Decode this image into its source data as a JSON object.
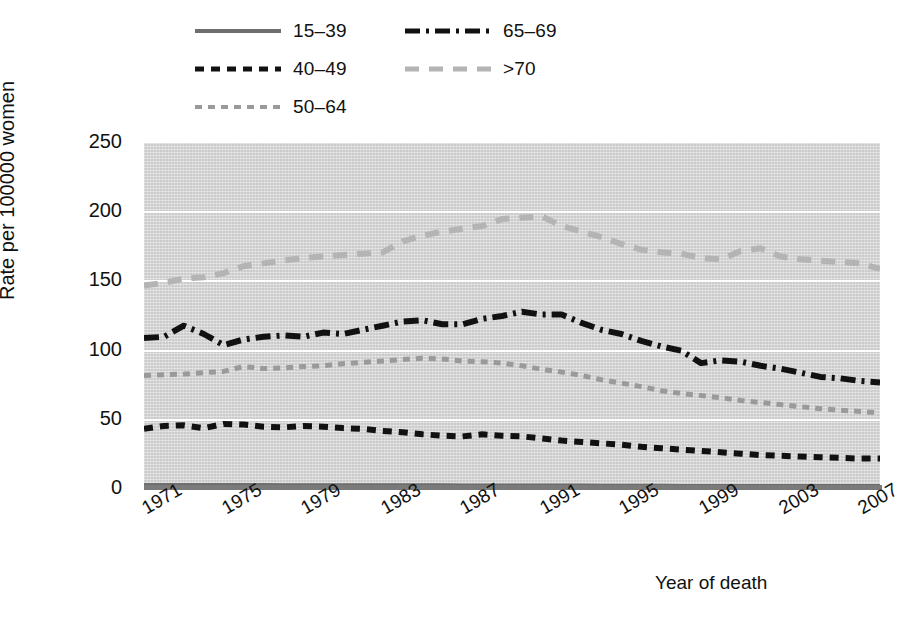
{
  "chart_data": {
    "type": "line",
    "title": "",
    "xlabel": "Year of death",
    "ylabel": "Rate per 100000 women",
    "xlim": [
      1971,
      2008
    ],
    "ylim": [
      0,
      250
    ],
    "yticks": [
      0,
      50,
      100,
      150,
      200,
      250
    ],
    "xticks": [
      1971,
      1975,
      1979,
      1983,
      1987,
      1991,
      1995,
      1999,
      2003,
      2007
    ],
    "grid": true,
    "legend_position": "top-left",
    "plot_background": "#d3d3d3",
    "x": [
      1971,
      1972,
      1973,
      1974,
      1975,
      1976,
      1977,
      1978,
      1979,
      1980,
      1981,
      1982,
      1983,
      1984,
      1985,
      1986,
      1987,
      1988,
      1989,
      1990,
      1991,
      1992,
      1993,
      1994,
      1995,
      1996,
      1997,
      1998,
      1999,
      2000,
      2001,
      2002,
      2003,
      2004,
      2005,
      2006,
      2007,
      2008
    ],
    "series": [
      {
        "name": "15–39",
        "color": "#6e6e6e",
        "dash": "solid",
        "values": [
          2.6,
          2.6,
          2.5,
          2.5,
          2.5,
          2.5,
          2.5,
          2.4,
          2.4,
          2.4,
          2.4,
          2.3,
          2.3,
          2.3,
          2.3,
          2.3,
          2.2,
          2.2,
          2.2,
          2.2,
          2.1,
          2.1,
          2.1,
          2.0,
          2.0,
          2.0,
          2.0,
          1.9,
          1.9,
          1.9,
          1.9,
          1.8,
          1.8,
          1.8,
          1.8,
          1.8,
          1.7,
          1.7
        ]
      },
      {
        "name": "40–49",
        "color": "#111111",
        "dash": "dashed",
        "values": [
          43.5,
          45.5,
          46.0,
          44.0,
          47.0,
          46.5,
          45.0,
          44.5,
          45.5,
          45.0,
          44.0,
          43.5,
          42.0,
          41.0,
          39.5,
          38.5,
          38.0,
          39.5,
          38.5,
          38.0,
          36.5,
          35.0,
          34.0,
          33.0,
          32.0,
          30.5,
          29.5,
          28.5,
          27.5,
          26.5,
          25.5,
          24.5,
          24.0,
          23.5,
          23.0,
          22.5,
          22.0,
          22.0
        ]
      },
      {
        "name": "50–64",
        "color": "#9a9a9a",
        "dash": "short-dash",
        "values": [
          82.0,
          82.5,
          83.0,
          84.0,
          85.0,
          88.5,
          87.0,
          87.5,
          88.5,
          89.0,
          90.5,
          91.5,
          92.5,
          93.5,
          94.5,
          94.0,
          92.5,
          92.0,
          91.0,
          89.0,
          86.5,
          84.5,
          82.0,
          79.0,
          76.5,
          74.0,
          71.0,
          69.0,
          67.5,
          66.0,
          64.0,
          62.5,
          61.0,
          59.5,
          58.0,
          57.0,
          56.0,
          55.0
        ]
      },
      {
        "name": "65–69",
        "color": "#111111",
        "dash": "dash-dot",
        "values": [
          109.0,
          110.0,
          118.0,
          112.0,
          104.0,
          108.0,
          110.0,
          111.0,
          110.0,
          113.0,
          112.0,
          115.0,
          118.0,
          121.0,
          122.0,
          119.0,
          119.0,
          123.0,
          125.0,
          128.0,
          126.0,
          126.0,
          120.0,
          115.0,
          112.0,
          107.0,
          103.0,
          100.0,
          91.0,
          93.0,
          92.0,
          89.0,
          87.0,
          84.0,
          81.0,
          80.0,
          78.0,
          77.0
        ]
      },
      {
        "name": ">70",
        "color": "#b4b4b4",
        "dash": "long-dash",
        "values": [
          147.0,
          149.0,
          152.0,
          153.0,
          156.0,
          161.0,
          163.0,
          165.0,
          167.0,
          168.0,
          169.0,
          170.0,
          171.0,
          179.0,
          183.0,
          186.0,
          188.0,
          190.0,
          195.0,
          196.0,
          197.0,
          190.0,
          186.0,
          182.0,
          177.0,
          173.0,
          171.0,
          170.0,
          167.0,
          166.0,
          172.0,
          174.0,
          168.0,
          166.0,
          165.0,
          164.0,
          163.0,
          159.0
        ]
      }
    ]
  },
  "legend": {
    "entries": [
      {
        "label": "15–39",
        "swatch": "solid-gray-line"
      },
      {
        "label": "65–69",
        "swatch": "dash-dot-black-line"
      },
      {
        "label": "40–49",
        "swatch": "dashed-black-line"
      },
      {
        "label": ">70",
        "swatch": "long-dash-light-gray-line"
      },
      {
        "label": "50–64",
        "swatch": "short-dash-gray-line"
      }
    ]
  },
  "axes": {
    "ylabel": "Rate per 100000 women",
    "xlabel": "Year of death",
    "yticks": [
      "250",
      "200",
      "150",
      "100",
      "50",
      "0"
    ],
    "xticks": [
      "1971",
      "1975",
      "1979",
      "1983",
      "1987",
      "1991",
      "1995",
      "1999",
      "2003",
      "2007"
    ]
  }
}
